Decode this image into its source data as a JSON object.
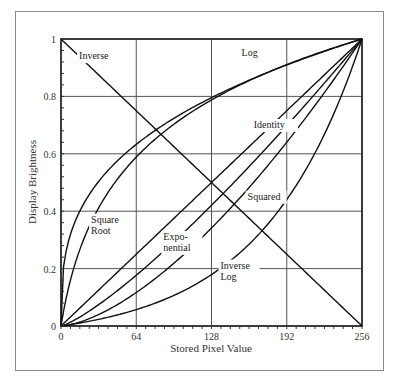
{
  "chart_data": {
    "type": "line",
    "title": "",
    "xlabel": "Stored Pixel Value",
    "ylabel": "Display Brightness",
    "xlim": [
      0,
      256
    ],
    "ylim": [
      0,
      1
    ],
    "grid": true,
    "xticks": [
      0,
      64,
      128,
      192,
      256
    ],
    "yticks": [
      0,
      0.2,
      0.4,
      0.6,
      0.8,
      1
    ],
    "ytick_labels": [
      "0",
      "0.2",
      "0.4",
      "0.6",
      "0.8",
      "1"
    ],
    "series": [
      {
        "name": "Inverse",
        "function": "1 - x/256",
        "label_pos": [
          0.06,
          0.93
        ]
      },
      {
        "name": "Log",
        "function": "log(1 + k*x/256)/log(1+k)",
        "label_pos": [
          0.6,
          0.94
        ]
      },
      {
        "name": "Square Root",
        "function": "sqrt(x/256)",
        "label_lines": [
          "Square",
          "Root"
        ],
        "label_pos": [
          0.1,
          0.36
        ]
      },
      {
        "name": "Identity",
        "function": "x/256",
        "label_pos": [
          0.64,
          0.69
        ]
      },
      {
        "name": "Squared",
        "function": "(x/256)^2",
        "label_pos": [
          0.62,
          0.44
        ]
      },
      {
        "name": "Exponential",
        "function": "(e^(x/256*c)-1)/(e^c-1)",
        "label_lines": [
          "Expo-",
          "nential"
        ],
        "label_pos": [
          0.34,
          0.3
        ]
      },
      {
        "name": "Inverse Log",
        "function": "(exp(x/256*ln(1+k))-1)/k",
        "label_lines": [
          "Inverse",
          "Log"
        ],
        "label_pos": [
          0.53,
          0.2
        ]
      }
    ]
  }
}
